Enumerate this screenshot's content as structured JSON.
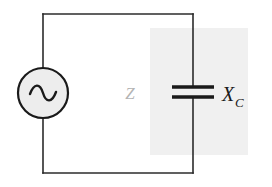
{
  "figure": {
    "name": "ac-circuit-with-capacitor",
    "background_color": "#ffffff",
    "width": 272,
    "height": 187
  },
  "shaded_region": {
    "name": "capacitive-branch-highlight",
    "color": "#f0f0f0",
    "x": 150,
    "y": 28,
    "width": 98,
    "height": 127
  },
  "wires": {
    "color": "#2b2b2b",
    "stroke_width": 1.6,
    "loop": {
      "left_x": 43,
      "right_x": 193,
      "top_y": 14,
      "bottom_y": 173
    }
  },
  "source": {
    "name": "ac-voltage-source",
    "symbol": "sine-wave",
    "center_x": 43,
    "center_y": 93,
    "radius": 25,
    "fill_color": "#ededed",
    "stroke_color": "#1a1a1a",
    "stroke_width": 2.2
  },
  "capacitor": {
    "name": "capacitor",
    "plate_left_x": 172,
    "plate_right_x": 214,
    "plate_top_y": 87,
    "plate_bottom_y": 97,
    "plate_thickness": 3.4,
    "color": "#1a1a1a"
  },
  "labels": {
    "impedance": {
      "text": "Z",
      "x": 130,
      "y": 99,
      "color": "#b4b4b4"
    },
    "reactance": {
      "base": "X",
      "subscript": "C",
      "x": 222,
      "y": 101,
      "color": "#1a1a1a"
    }
  }
}
